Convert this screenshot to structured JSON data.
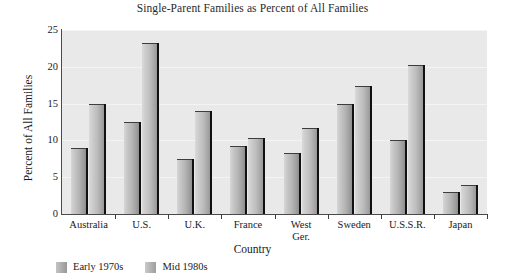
{
  "chart_data": {
    "type": "bar",
    "title": "Single-Parent Families as Percent of All Families",
    "xlabel": "Country",
    "ylabel": "Percent of All Families",
    "categories": [
      "Australia",
      "U.S.",
      "U.K.",
      "France",
      "West Ger.",
      "Sweden",
      "U.S.S.R.",
      "Japan"
    ],
    "category_lines": [
      [
        "Australia"
      ],
      [
        "U.S."
      ],
      [
        "U.K."
      ],
      [
        "France"
      ],
      [
        "West",
        "Ger."
      ],
      [
        "Sweden"
      ],
      [
        "U.S.S.R."
      ],
      [
        "Japan"
      ]
    ],
    "series": [
      {
        "name": "Early 1970s",
        "color": "#b4b4b4",
        "values": [
          9.0,
          12.5,
          7.5,
          9.2,
          8.3,
          15.0,
          10.0,
          3.0
        ]
      },
      {
        "name": "Mid 1980s",
        "color": "#bcbcbc",
        "values": [
          15.0,
          23.3,
          14.0,
          10.3,
          11.7,
          17.4,
          20.2,
          4.0
        ]
      }
    ],
    "ylim": [
      0,
      25
    ],
    "yticks": [
      0,
      5,
      10,
      15,
      20,
      25
    ],
    "ytick_labels": [
      "0",
      "5",
      "10",
      "15",
      "20",
      "25"
    ],
    "grid": true,
    "legend_position": "below-bottom-left",
    "plot_background": "#e9e9e9",
    "gridline_color": "#f4f4f4",
    "axis_color": "#4a4a4a"
  }
}
